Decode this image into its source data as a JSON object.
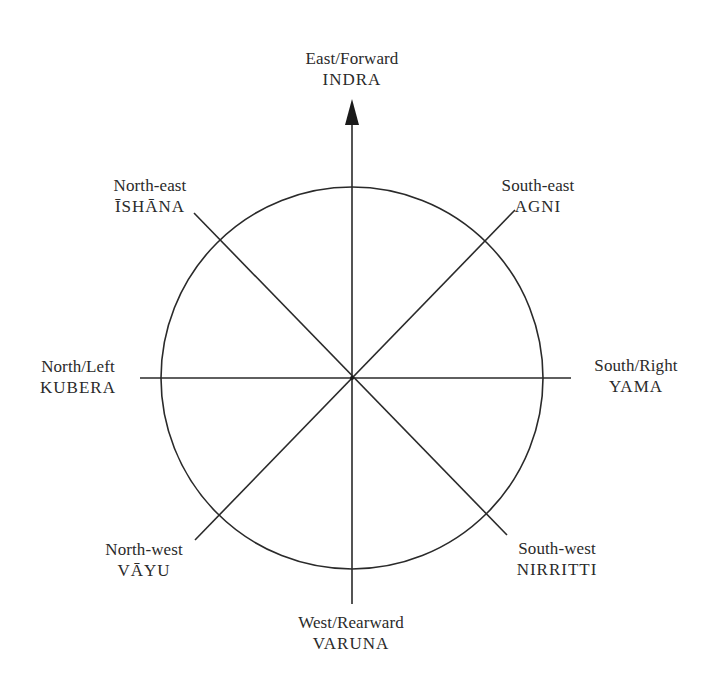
{
  "diagram": {
    "type": "compass-rose",
    "stroke_color": "#2a2a2a",
    "center": [
      352,
      377
    ],
    "radius": 192,
    "arrow": {
      "direction": "up",
      "label_ref": "east"
    },
    "directions": {
      "east": {
        "direction": "East/Forward",
        "deity": "INDRA"
      },
      "southeast": {
        "direction": "South-east",
        "deity": "AGNI"
      },
      "south": {
        "direction": "South/Right",
        "deity": "YAMA"
      },
      "southwest": {
        "direction": "South-west",
        "deity": "NIRRITTI"
      },
      "west": {
        "direction": "West/Rearward",
        "deity": "VARUNA"
      },
      "northwest": {
        "direction": "North-west",
        "deity": "VĀYU"
      },
      "north": {
        "direction": "North/Left",
        "deity": "KUBERA"
      },
      "northeast": {
        "direction": "North-east",
        "deity": "ĪSHĀNA"
      }
    }
  }
}
